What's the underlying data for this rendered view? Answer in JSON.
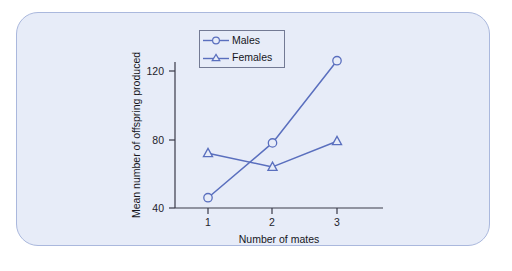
{
  "panel": {
    "background_color": "#e7ecf8",
    "border_color": "#aab8dd"
  },
  "legend": {
    "position": "top-center-left",
    "entries": [
      {
        "label": "Males",
        "marker": "circle-marker-icon",
        "color": "#5a6fbe"
      },
      {
        "label": "Females",
        "marker": "triangle-marker-icon",
        "color": "#5a6fbe"
      }
    ]
  },
  "chart_data": {
    "type": "line",
    "title": "",
    "xlabel": "Number of mates",
    "ylabel": "Mean number of offspring produced",
    "x": [
      1,
      2,
      3
    ],
    "xtick_labels": [
      "1",
      "2",
      "3"
    ],
    "ytick_labels": [
      "40",
      "80",
      "120"
    ],
    "yticks": [
      40,
      80,
      120
    ],
    "xlim": [
      0.5,
      3.6
    ],
    "ylim": [
      40,
      135
    ],
    "grid": false,
    "legend_position": "top-left-inside",
    "series": [
      {
        "name": "Males",
        "marker": "circle",
        "color": "#5a6fbe",
        "values": [
          46,
          78,
          126
        ]
      },
      {
        "name": "Females",
        "marker": "triangle",
        "color": "#5a6fbe",
        "values": [
          72,
          64,
          79
        ]
      }
    ]
  }
}
